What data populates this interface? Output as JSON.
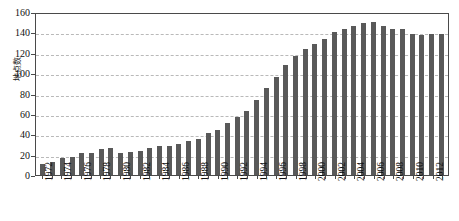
{
  "chart_data": {
    "type": "bar",
    "title": "",
    "xlabel": "",
    "ylabel": "地点数",
    "ylim": [
      0,
      160
    ],
    "yticks": [
      0,
      20,
      40,
      60,
      80,
      100,
      120,
      140,
      160
    ],
    "grid": true,
    "legend": null,
    "bar_color": "#595959",
    "grid_color": "#b9b9b9",
    "axis_color": "#4a4a4a",
    "categories": [
      "1972",
      "1973",
      "1974",
      "1975",
      "1976",
      "1977",
      "1978",
      "1979",
      "1980",
      "1981",
      "1982",
      "1983",
      "1984",
      "1985",
      "1986",
      "1987",
      "1988",
      "1989",
      "1990",
      "1991",
      "1992",
      "1993",
      "1994",
      "1995",
      "1996",
      "1997",
      "1998",
      "1999",
      "2000",
      "2001",
      "2002",
      "2003",
      "2004",
      "2005",
      "2006",
      "2007",
      "2008",
      "2009",
      "2010",
      "2011",
      "2012",
      "2013"
    ],
    "tick_labels": [
      "1972",
      "",
      "1974",
      "",
      "1976",
      "",
      "1978",
      "",
      "1980",
      "",
      "1982",
      "",
      "1984",
      "",
      "1986",
      "",
      "1988",
      "",
      "1990",
      "",
      "1992",
      "",
      "1994",
      "",
      "1996",
      "",
      "1998",
      "",
      "2000",
      "",
      "2002",
      "",
      "2004",
      "",
      "2006",
      "",
      "2008",
      "",
      "2010",
      "",
      "2012",
      ""
    ],
    "values": [
      11,
      13,
      17,
      18,
      22,
      22,
      26,
      27,
      22,
      23,
      24,
      27,
      28,
      28,
      30,
      33,
      35,
      41,
      44,
      51,
      57,
      63,
      74,
      85,
      96,
      108,
      117,
      124,
      129,
      134,
      140,
      143,
      146,
      149,
      150,
      146,
      143,
      143,
      138,
      137,
      138,
      138
    ]
  }
}
